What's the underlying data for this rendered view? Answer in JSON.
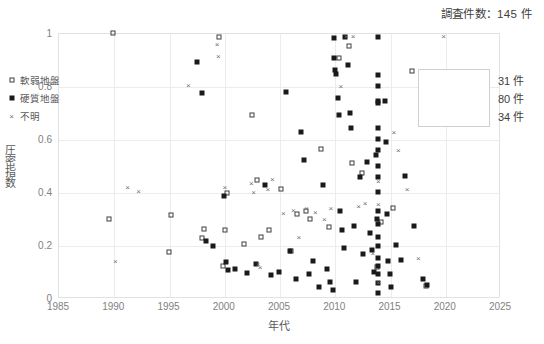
{
  "header": {
    "count_title": "調査件数：145 件"
  },
  "chart_data": {
    "type": "scatter",
    "title": "調査件数：145 件",
    "xlabel": "年代",
    "ylabel": "圧密指数",
    "xlim": [
      1985,
      2025
    ],
    "ylim": [
      0,
      1
    ],
    "xticks": [
      1985,
      1990,
      1995,
      2000,
      2005,
      2010,
      2015,
      2020,
      2025
    ],
    "yticks": [
      "0",
      "0.2",
      "0.4",
      "0.6",
      "0.8",
      "1"
    ],
    "ytick_values": [
      0,
      0.2,
      0.4,
      0.6,
      0.8,
      1
    ],
    "grid": true,
    "legend_position": "right-top-inside",
    "series": [
      {
        "name": "軟弱地盤",
        "marker": "open-square",
        "count_label": "31 件",
        "count": 31,
        "points": [
          [
            1990.0,
            1.0
          ],
          [
            1989.6,
            0.3
          ],
          [
            1995.2,
            0.315
          ],
          [
            1995.0,
            0.175
          ],
          [
            1998.0,
            0.225
          ],
          [
            1998.2,
            0.262
          ],
          [
            1999.6,
            0.985
          ],
          [
            1999.9,
            0.12
          ],
          [
            2000.1,
            0.258
          ],
          [
            2000.3,
            0.395
          ],
          [
            2001.8,
            0.205
          ],
          [
            2002.6,
            0.692
          ],
          [
            2003.0,
            0.447
          ],
          [
            2003.4,
            0.23
          ],
          [
            2004.1,
            0.255
          ],
          [
            2005.2,
            0.412
          ],
          [
            2006.1,
            0.177
          ],
          [
            2006.6,
            0.318
          ],
          [
            2007.4,
            0.33
          ],
          [
            2007.8,
            0.3
          ],
          [
            2008.8,
            0.562
          ],
          [
            2009.5,
            0.268
          ],
          [
            2010.4,
            0.905
          ],
          [
            2011.3,
            0.952
          ],
          [
            2011.6,
            0.508
          ],
          [
            2012.5,
            0.47
          ],
          [
            2013.9,
            0.118
          ],
          [
            2014.2,
            0.285
          ],
          [
            2015.3,
            0.338
          ],
          [
            2017.0,
            0.855
          ],
          [
            2018.3,
            0.045
          ]
        ]
      },
      {
        "name": "硬質地盤",
        "marker": "filled-square",
        "count_label": "80 件",
        "count": 80,
        "points": [
          [
            1997.6,
            0.89
          ],
          [
            1998.0,
            0.775
          ],
          [
            1998.4,
            0.215
          ],
          [
            1999.0,
            0.198
          ],
          [
            2000.0,
            0.385
          ],
          [
            2000.2,
            0.135
          ],
          [
            2000.4,
            0.105
          ],
          [
            2001.0,
            0.108
          ],
          [
            2002.1,
            0.095
          ],
          [
            2002.9,
            0.13
          ],
          [
            2003.7,
            0.425
          ],
          [
            2004.3,
            0.085
          ],
          [
            2005.0,
            0.1
          ],
          [
            2005.6,
            0.778
          ],
          [
            2006.0,
            0.178
          ],
          [
            2006.5,
            0.07
          ],
          [
            2007.0,
            0.625
          ],
          [
            2007.3,
            0.52
          ],
          [
            2007.7,
            0.09
          ],
          [
            2008.1,
            0.138
          ],
          [
            2008.6,
            0.042
          ],
          [
            2009.0,
            0.425
          ],
          [
            2009.3,
            0.108
          ],
          [
            2009.6,
            0.06
          ],
          [
            2009.9,
            0.03
          ],
          [
            2010.0,
            0.982
          ],
          [
            2010.0,
            0.905
          ],
          [
            2010.1,
            0.862
          ],
          [
            2010.2,
            0.845
          ],
          [
            2010.3,
            0.755
          ],
          [
            2010.4,
            0.69
          ],
          [
            2010.5,
            0.33
          ],
          [
            2010.7,
            0.255
          ],
          [
            2010.9,
            0.19
          ],
          [
            2011.0,
            0.985
          ],
          [
            2011.2,
            0.88
          ],
          [
            2011.4,
            0.7
          ],
          [
            2011.5,
            0.64
          ],
          [
            2011.8,
            0.27
          ],
          [
            2012.0,
            0.06
          ],
          [
            2012.3,
            0.455
          ],
          [
            2012.6,
            0.165
          ],
          [
            2013.0,
            0.512
          ],
          [
            2013.2,
            0.245
          ],
          [
            2013.4,
            0.18
          ],
          [
            2013.6,
            0.098
          ],
          [
            2013.8,
            0.54
          ],
          [
            2013.9,
            0.3
          ],
          [
            2014.0,
            0.985
          ],
          [
            2014.0,
            0.84
          ],
          [
            2014.0,
            0.8
          ],
          [
            2014.0,
            0.745
          ],
          [
            2014.0,
            0.735
          ],
          [
            2014.0,
            0.64
          ],
          [
            2014.0,
            0.6
          ],
          [
            2014.0,
            0.56
          ],
          [
            2014.0,
            0.5
          ],
          [
            2014.0,
            0.455
          ],
          [
            2014.0,
            0.4
          ],
          [
            2014.0,
            0.33
          ],
          [
            2014.0,
            0.28
          ],
          [
            2014.0,
            0.23
          ],
          [
            2014.0,
            0.195
          ],
          [
            2014.0,
            0.15
          ],
          [
            2014.0,
            0.12
          ],
          [
            2014.0,
            0.09
          ],
          [
            2014.0,
            0.055
          ],
          [
            2014.0,
            0.02
          ],
          [
            2014.6,
            0.742
          ],
          [
            2014.7,
            0.59
          ],
          [
            2014.8,
            0.318
          ],
          [
            2014.9,
            0.14
          ],
          [
            2015.0,
            0.09
          ],
          [
            2015.1,
            0.04
          ],
          [
            2015.6,
            0.2
          ],
          [
            2016.0,
            0.145
          ],
          [
            2016.4,
            0.462
          ],
          [
            2017.2,
            0.27
          ],
          [
            2018.0,
            0.07
          ],
          [
            2018.4,
            0.048
          ]
        ]
      },
      {
        "name": "不明",
        "marker": "cross",
        "count_label": "34 件",
        "count": 34,
        "points": [
          [
            1990.2,
            0.14
          ],
          [
            1991.3,
            0.418
          ],
          [
            1992.3,
            0.405
          ],
          [
            1996.8,
            0.805
          ],
          [
            1999.4,
            0.96
          ],
          [
            1999.5,
            0.912
          ],
          [
            2000.1,
            0.418
          ],
          [
            2002.5,
            0.435
          ],
          [
            2002.7,
            0.4
          ],
          [
            2003.1,
            0.13
          ],
          [
            2003.3,
            0.118
          ],
          [
            2004.0,
            0.41
          ],
          [
            2004.4,
            0.448
          ],
          [
            2005.4,
            0.322
          ],
          [
            2006.3,
            0.333
          ],
          [
            2006.8,
            0.232
          ],
          [
            2007.5,
            0.34
          ],
          [
            2008.3,
            0.325
          ],
          [
            2009.1,
            0.3
          ],
          [
            2009.7,
            0.338
          ],
          [
            2010.6,
            0.8
          ],
          [
            2011.1,
            0.99
          ],
          [
            2011.7,
            0.99
          ],
          [
            2012.2,
            0.348
          ],
          [
            2012.8,
            0.358
          ],
          [
            2013.5,
            0.168
          ],
          [
            2014.0,
            0.44
          ],
          [
            2014.0,
            0.355
          ],
          [
            2014.0,
            0.062
          ],
          [
            2015.4,
            0.625
          ],
          [
            2015.8,
            0.56
          ],
          [
            2016.6,
            0.41
          ],
          [
            2017.6,
            0.15
          ],
          [
            2019.9,
            0.99
          ]
        ]
      }
    ]
  },
  "legend": {
    "rows": [
      {
        "label": "軟弱地盤",
        "count": "31 件",
        "marker": "open-square"
      },
      {
        "label": "硬質地盤",
        "count": "80 件",
        "marker": "filled-square"
      },
      {
        "label": "不明",
        "count": "34 件",
        "marker": "cross"
      }
    ]
  }
}
